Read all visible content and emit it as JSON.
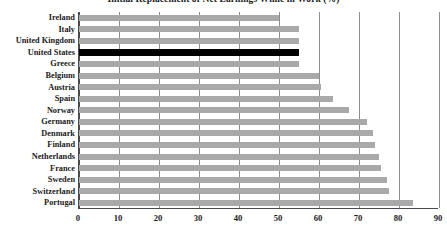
{
  "chart_data": {
    "type": "bar",
    "orientation": "horizontal",
    "title": "Initial Replacement of Net Earnings While in Work (%)",
    "xlabel": "",
    "ylabel": "",
    "xlim": [
      0,
      90
    ],
    "xticks": [
      0,
      10,
      20,
      30,
      40,
      50,
      60,
      70,
      80,
      90
    ],
    "grid": true,
    "legend": "none",
    "categories": [
      "Ireland",
      "Italy",
      "United Kingdom",
      "United States",
      "Greece",
      "Belgium",
      "Austria",
      "Spain",
      "Norway",
      "Germany",
      "Denmark",
      "Finland",
      "Netherlands",
      "France",
      "Sweden",
      "Switzerland",
      "Portugal"
    ],
    "values": [
      50,
      55,
      55,
      55,
      55,
      60,
      60.5,
      63.5,
      67.5,
      72,
      73.5,
      74,
      75,
      75.5,
      77,
      77.5,
      83.5
    ],
    "highlight_category": "United States",
    "colors": {
      "bar": "#a9a9a9",
      "highlight_bar": "#000000",
      "axis": "#4a4a4a",
      "gridline": "#8d8d8d",
      "text": "#1a1a1a",
      "background": "#ffffff"
    }
  }
}
